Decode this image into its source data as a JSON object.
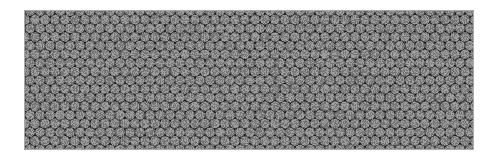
{
  "image": {
    "kind": "micrograph-pattern",
    "width": 498,
    "height": 162,
    "background_color": "#ffffff",
    "description": "Hexagonal close-packed array of circular features on a dark substrate"
  },
  "panel": {
    "name": "packed-circle-array-panel",
    "x": 24,
    "y": 10,
    "width": 450,
    "height": 140,
    "substrate_color": "#1c1c1c",
    "border_color": "#a8a8a8",
    "border_width": 1
  },
  "pattern": {
    "type": "hexagonal-close-packed",
    "circle_fill": "#8b8b8b",
    "circle_stroke": "#9a9a9a",
    "circle_stroke_width": 0.4,
    "circle_diameter": 9.2,
    "circle_radius": 4.6,
    "column_pitch": 10.0,
    "row_pitch": 8.66,
    "row_offset": 5.0,
    "columns": 47,
    "rows": 18,
    "noise_opacity": 0.16
  }
}
